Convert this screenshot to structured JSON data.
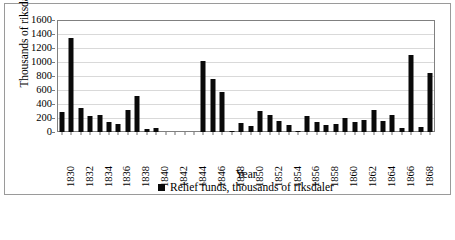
{
  "chart_data": {
    "type": "bar",
    "title": "",
    "xlabel": "Year",
    "ylabel": "Thousands of riksdaler",
    "ylim": [
      0,
      1600
    ],
    "yticks": [
      0,
      200,
      400,
      600,
      800,
      1000,
      1200,
      1400,
      1600
    ],
    "grid": true,
    "legend_position": "bottom",
    "series": [
      {
        "name": "Relief funds, thousands of riksdaler",
        "color": "#0a0a0a",
        "values": [
          280,
          1345,
          345,
          235,
          250,
          150,
          115,
          310,
          520,
          40,
          60,
          0,
          0,
          0,
          0,
          1015,
          755,
          570,
          20,
          125,
          90,
          305,
          250,
          160,
          100,
          20,
          235,
          140,
          105,
          120,
          195,
          140,
          175,
          320,
          155,
          250,
          60,
          1100,
          75,
          845
        ]
      }
    ],
    "categories": [
      1830,
      1831,
      1832,
      1833,
      1834,
      1835,
      1836,
      1837,
      1838,
      1839,
      1840,
      1841,
      1842,
      1843,
      1844,
      1845,
      1846,
      1847,
      1848,
      1849,
      1850,
      1851,
      1852,
      1853,
      1854,
      1855,
      1856,
      1857,
      1858,
      1859,
      1860,
      1861,
      1862,
      1863,
      1864,
      1865,
      1866,
      1867,
      1868,
      1869
    ],
    "xtick_labels": [
      "1830",
      "1832",
      "1834",
      "1836",
      "1838",
      "1840",
      "1842",
      "1844",
      "1846",
      "1848",
      "1850",
      "1852",
      "1854",
      "1856",
      "1858",
      "1860",
      "1862",
      "1864",
      "1866",
      "1868"
    ],
    "xtick_categories": [
      1830,
      1832,
      1834,
      1836,
      1838,
      1840,
      1842,
      1844,
      1846,
      1848,
      1850,
      1852,
      1854,
      1856,
      1858,
      1860,
      1862,
      1864,
      1866,
      1868
    ]
  },
  "legend": {
    "entries": [
      {
        "label": "Relief funds, thousands of riksdaler",
        "color": "#0a0a0a",
        "marker": "square"
      }
    ]
  },
  "axes": {
    "x_title": "Year",
    "y_title": "Thousands of riksdaler"
  },
  "caption": {
    "text": ""
  },
  "colors": {
    "bar": "#0a0a0a",
    "frame": "#9a9a9a",
    "plot_border": "#808080",
    "gridline": "#d9d9d9",
    "background": "#ffffff"
  }
}
